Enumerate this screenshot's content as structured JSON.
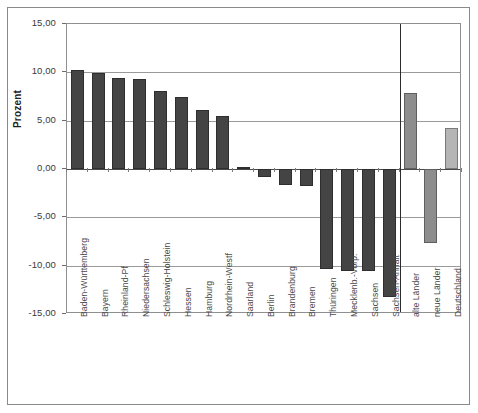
{
  "chart_data": {
    "type": "bar",
    "title": "",
    "xlabel": "",
    "ylabel": "Prozent",
    "ylim": [
      -15,
      15
    ],
    "grid": true,
    "legend": false,
    "ytick_labels": [
      "15,00",
      "10,00",
      "5,00",
      "0,00",
      "-5,00",
      "-10,00",
      "-15,00"
    ],
    "ytick_values": [
      15,
      10,
      5,
      0,
      -5,
      -10,
      -15
    ],
    "categories": [
      "Baden-Württemberg",
      "Bayern",
      "Rheinland-Pf",
      "Niedersachsen",
      "Schleswig-Holstein",
      "Hessen",
      "Hamburg",
      "Nordrhein-Westf",
      "Saarland",
      "Berlin",
      "Brandenburg",
      "Bremen",
      "Thüringen",
      "Mecklenb.-Vorp.",
      "Sachsen",
      "Sachsen-Anhalt",
      "alte Länder",
      "neue Länder",
      "Deutschland"
    ],
    "values": [
      10.2,
      9.9,
      9.4,
      9.3,
      8.1,
      7.4,
      6.1,
      5.5,
      0.2,
      -0.8,
      -1.7,
      -1.8,
      -10.3,
      -10.5,
      -10.6,
      -13.2,
      7.9,
      -7.7,
      4.2
    ],
    "series_colors": {
      "laender_dark": "#444444",
      "aggregate_mid": "#8d8d8d",
      "aggregate_light": "#b5b5b5"
    },
    "group_divider_after_category": "Sachsen-Anhalt"
  }
}
